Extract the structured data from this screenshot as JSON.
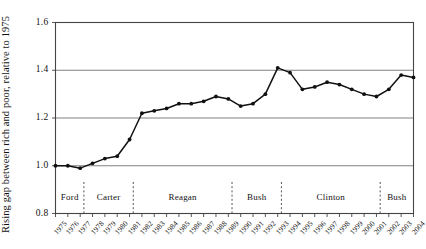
{
  "chart_data": {
    "type": "line",
    "title": "",
    "xlabel": "",
    "ylabel": "Rising gap between rich and poor, relative to 1975",
    "xlim": [
      1975,
      2004
    ],
    "ylim": [
      0.8,
      1.6
    ],
    "ytick_labels": [
      "0.8",
      "1.0",
      "1.2",
      "1.4",
      "1.6"
    ],
    "ytick_values": [
      0.8,
      1.0,
      1.2,
      1.4,
      1.6
    ],
    "grid": "horizontal",
    "legend": "none",
    "markers": "filled-circle",
    "line_color": "#111111",
    "grid_color": "#808080",
    "axis_color": "#444444",
    "x": [
      1975,
      1976,
      1977,
      1978,
      1979,
      1980,
      1981,
      1982,
      1983,
      1984,
      1985,
      1986,
      1987,
      1988,
      1989,
      1990,
      1991,
      1992,
      1993,
      1994,
      1995,
      1996,
      1997,
      1998,
      1999,
      2000,
      2001,
      2002,
      2003,
      2004
    ],
    "xtick_labels": [
      "1975",
      "1976",
      "1977",
      "1978",
      "1979",
      "1980",
      "1981",
      "1982",
      "1983",
      "1984",
      "1985",
      "1986",
      "1987",
      "1988",
      "1989",
      "1990",
      "1991",
      "1992",
      "1993",
      "1994",
      "1995",
      "1996",
      "1997",
      "1998",
      "1999",
      "2000",
      "2001",
      "2002",
      "2003",
      "2004"
    ],
    "values": [
      1.0,
      1.0,
      0.99,
      1.01,
      1.03,
      1.04,
      1.11,
      1.22,
      1.23,
      1.24,
      1.26,
      1.26,
      1.27,
      1.29,
      1.28,
      1.25,
      1.26,
      1.3,
      1.41,
      1.39,
      1.32,
      1.33,
      1.35,
      1.34,
      1.32,
      1.3,
      1.29,
      1.32,
      1.38,
      1.37
    ],
    "eras": [
      {
        "label": "Ford",
        "start": 1975,
        "end": 1977.3
      },
      {
        "label": "Carter",
        "start": 1977.3,
        "end": 1981.3
      },
      {
        "label": "Reagan",
        "start": 1981.3,
        "end": 1989.3
      },
      {
        "label": "Bush",
        "start": 1989.3,
        "end": 1993.3
      },
      {
        "label": "Clinton",
        "start": 1993.3,
        "end": 2001.3
      },
      {
        "label": "Bush",
        "start": 2001.3,
        "end": 2004.6
      }
    ],
    "era_divider_years": [
      1977.3,
      1981.3,
      1989.3,
      1993.3,
      2001.3
    ]
  }
}
